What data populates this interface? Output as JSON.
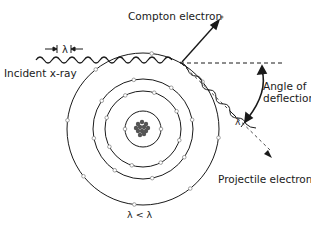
{
  "diagram": {
    "labels": {
      "compton_electron": "Compton electron",
      "incident_xray": "Incident x-ray",
      "angle_line1": "Angle of",
      "angle_line2": "deflection",
      "projectile_electron": "Projectile electron",
      "incident_wavelength": "λ",
      "scattered_wavelength": "λ",
      "relation": "λ < λ"
    },
    "atom": {
      "shell_count": 4,
      "nucleus": "nucleus-cluster"
    },
    "colors": {
      "line": "#1a1a1a",
      "electron": "#8a8a8a",
      "background": "#ffffff"
    }
  }
}
